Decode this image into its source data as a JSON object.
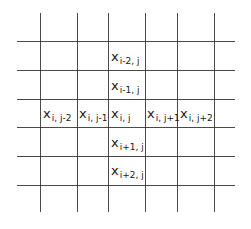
{
  "diagram": {
    "type": "grid-stencil",
    "colors": {
      "line": "#2a2a2a",
      "text": "#1a1a1a",
      "background": "#ffffff"
    },
    "grid": {
      "vertical_x": [
        40,
        77,
        108,
        145,
        177,
        214
      ],
      "vertical_y_range": [
        13,
        212
      ],
      "horizontal_y": [
        41,
        70,
        99,
        127,
        156,
        185
      ],
      "horizontal_x_range": [
        17,
        235
      ]
    },
    "cells": [
      {
        "id": "x-i-minus2-j",
        "base": "x",
        "sub": "i-2, j",
        "x": 111,
        "y": 50
      },
      {
        "id": "x-i-minus1-j",
        "base": "x",
        "sub": "i-1, j",
        "x": 111,
        "y": 79
      },
      {
        "id": "x-i-j-minus2",
        "base": "x",
        "sub": "i, j-2",
        "x": 43,
        "y": 107
      },
      {
        "id": "x-i-j-minus1",
        "base": "x",
        "sub": "i, j-1",
        "x": 79,
        "y": 107
      },
      {
        "id": "x-i-j",
        "base": "x",
        "sub": "i, j",
        "x": 111,
        "y": 107
      },
      {
        "id": "x-i-j-plus1",
        "base": "x",
        "sub": "i, j+1",
        "x": 147,
        "y": 107
      },
      {
        "id": "x-i-j-plus2",
        "base": "x",
        "sub": "i, j+2",
        "x": 180,
        "y": 107
      },
      {
        "id": "x-i-plus1-j",
        "base": "x",
        "sub": "i+1, j",
        "x": 111,
        "y": 136
      },
      {
        "id": "x-i-plus2-j",
        "base": "x",
        "sub": "i+2, j",
        "x": 111,
        "y": 164
      }
    ]
  }
}
